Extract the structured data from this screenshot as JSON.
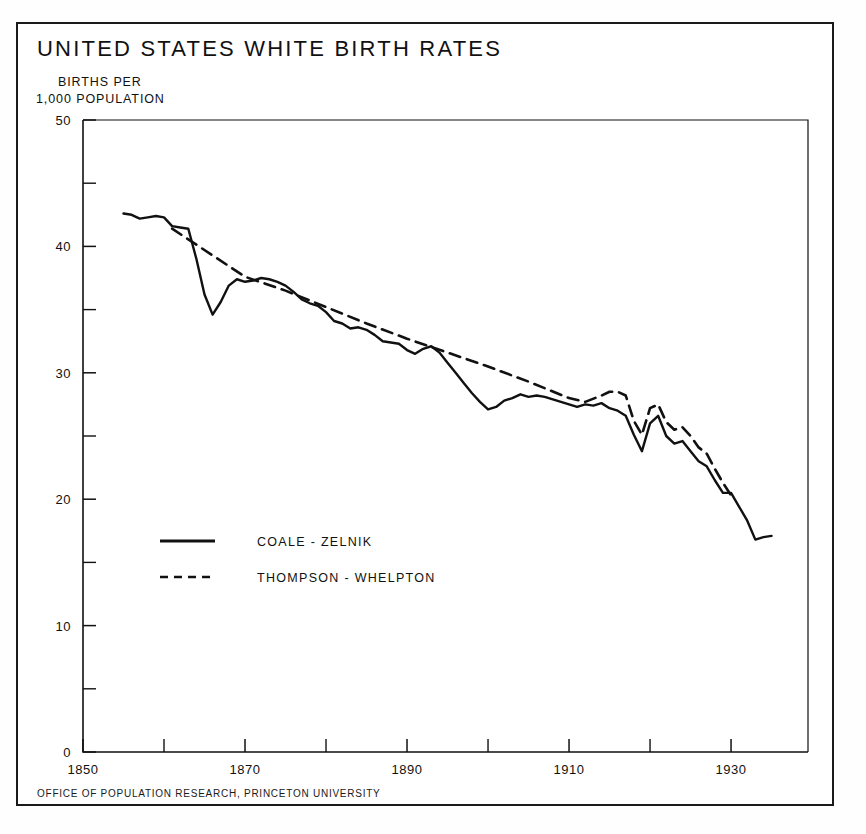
{
  "figure": {
    "title": "UNITED STATES WHITE BIRTH RATES",
    "caption_line_1": "BIRTHS PER",
    "caption_line_2": "1,000 POPULATION",
    "footer": "OFFICE OF POPULATION RESEARCH, PRINCETON UNIVERSITY",
    "ink_color": "#111111",
    "background_color": "#ffffff"
  },
  "chart_data": {
    "type": "line",
    "title": "UNITED STATES WHITE BIRTH RATES",
    "subtitle": "BIRTHS PER 1,000 POPULATION",
    "xlabel": "",
    "ylabel": "BIRTHS PER 1,000 POPULATION",
    "xlim": [
      1850,
      1939.5
    ],
    "ylim": [
      0,
      50
    ],
    "grid": false,
    "legend_position": "inside-lower-left",
    "x_ticks_major": [
      1850,
      1870,
      1890,
      1910,
      1930
    ],
    "x_ticks_minor": [
      1860,
      1880,
      1900,
      1920
    ],
    "x_tick_labels": [
      "1850",
      "1870",
      "1890",
      "1910",
      "1930"
    ],
    "y_ticks_major": [
      0,
      10,
      20,
      30,
      40,
      50
    ],
    "y_ticks_minor": [
      5,
      15,
      25,
      35,
      45
    ],
    "y_tick_labels": [
      "0",
      "10",
      "20",
      "30",
      "40",
      "50"
    ],
    "series": [
      {
        "name": "COALE - ZELNIK",
        "style": "solid",
        "color": "#111111",
        "points": [
          [
            1855,
            42.6
          ],
          [
            1856,
            42.5
          ],
          [
            1857,
            42.2
          ],
          [
            1858,
            42.3
          ],
          [
            1859,
            42.4
          ],
          [
            1860,
            42.3
          ],
          [
            1861,
            41.6
          ],
          [
            1862,
            41.5
          ],
          [
            1863,
            41.4
          ],
          [
            1864,
            39.0
          ],
          [
            1865,
            36.2
          ],
          [
            1866,
            34.6
          ],
          [
            1867,
            35.6
          ],
          [
            1868,
            36.9
          ],
          [
            1869,
            37.4
          ],
          [
            1870,
            37.2
          ],
          [
            1871,
            37.3
          ],
          [
            1872,
            37.5
          ],
          [
            1873,
            37.4
          ],
          [
            1874,
            37.2
          ],
          [
            1875,
            36.9
          ],
          [
            1876,
            36.4
          ],
          [
            1877,
            35.8
          ],
          [
            1878,
            35.5
          ],
          [
            1879,
            35.3
          ],
          [
            1880,
            34.8
          ],
          [
            1881,
            34.1
          ],
          [
            1882,
            33.9
          ],
          [
            1883,
            33.5
          ],
          [
            1884,
            33.6
          ],
          [
            1885,
            33.4
          ],
          [
            1886,
            33.0
          ],
          [
            1887,
            32.5
          ],
          [
            1888,
            32.4
          ],
          [
            1889,
            32.3
          ],
          [
            1890,
            31.8
          ],
          [
            1891,
            31.5
          ],
          [
            1892,
            31.9
          ],
          [
            1893,
            32.1
          ],
          [
            1894,
            31.6
          ],
          [
            1895,
            30.8
          ],
          [
            1896,
            30.0
          ],
          [
            1897,
            29.2
          ],
          [
            1898,
            28.4
          ],
          [
            1899,
            27.7
          ],
          [
            1900,
            27.1
          ],
          [
            1901,
            27.3
          ],
          [
            1902,
            27.8
          ],
          [
            1903,
            28.0
          ],
          [
            1904,
            28.3
          ],
          [
            1905,
            28.1
          ],
          [
            1906,
            28.2
          ],
          [
            1907,
            28.1
          ],
          [
            1908,
            27.9
          ],
          [
            1909,
            27.7
          ],
          [
            1910,
            27.5
          ],
          [
            1911,
            27.3
          ],
          [
            1912,
            27.5
          ],
          [
            1913,
            27.4
          ],
          [
            1914,
            27.6
          ],
          [
            1915,
            27.2
          ],
          [
            1916,
            27.0
          ],
          [
            1917,
            26.6
          ],
          [
            1918,
            25.1
          ],
          [
            1919,
            23.8
          ],
          [
            1920,
            26.0
          ],
          [
            1921,
            26.6
          ],
          [
            1922,
            25.0
          ],
          [
            1923,
            24.4
          ],
          [
            1924,
            24.6
          ],
          [
            1925,
            23.8
          ],
          [
            1926,
            23.0
          ],
          [
            1927,
            22.6
          ],
          [
            1928,
            21.5
          ],
          [
            1929,
            20.5
          ],
          [
            1930,
            20.5
          ],
          [
            1931,
            19.4
          ],
          [
            1932,
            18.3
          ],
          [
            1933,
            16.8
          ],
          [
            1934,
            17.0
          ],
          [
            1935,
            17.1
          ]
        ]
      },
      {
        "name": "THOMPSON - WHELPTON",
        "style": "dashed",
        "color": "#111111",
        "points": [
          [
            1861,
            41.4
          ],
          [
            1870,
            37.6
          ],
          [
            1875,
            36.5
          ],
          [
            1880,
            35.2
          ],
          [
            1885,
            33.9
          ],
          [
            1890,
            32.7
          ],
          [
            1895,
            31.6
          ],
          [
            1900,
            30.5
          ],
          [
            1905,
            29.3
          ],
          [
            1910,
            28.0
          ],
          [
            1912,
            27.7
          ],
          [
            1914,
            28.2
          ],
          [
            1915,
            28.5
          ],
          [
            1916,
            28.5
          ],
          [
            1917,
            28.2
          ],
          [
            1918,
            26.2
          ],
          [
            1919,
            25.1
          ],
          [
            1920,
            27.2
          ],
          [
            1921,
            27.5
          ],
          [
            1922,
            26.1
          ],
          [
            1923,
            25.5
          ],
          [
            1924,
            25.7
          ],
          [
            1925,
            25.0
          ],
          [
            1926,
            24.1
          ],
          [
            1927,
            23.6
          ],
          [
            1928,
            22.4
          ],
          [
            1929,
            21.3
          ],
          [
            1930,
            20.3
          ]
        ]
      }
    ],
    "annotations": []
  },
  "legend": {
    "entries": [
      {
        "label": "COALE - ZELNIK",
        "style": "solid"
      },
      {
        "label": "THOMPSON - WHELPTON",
        "style": "dashed"
      }
    ]
  }
}
